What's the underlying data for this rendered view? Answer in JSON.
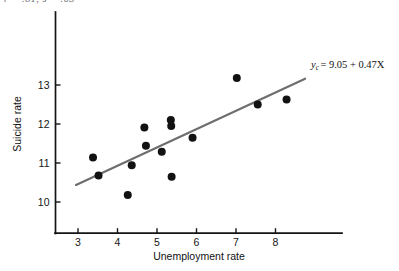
{
  "figure": {
    "background": "#ffffff",
    "clipped_caption": "r = .81, s = .63",
    "width": 399,
    "height": 271
  },
  "chart_data": {
    "type": "scatter",
    "title": "",
    "xlabel": "Unemployment rate",
    "ylabel": "Suicide rate",
    "xlim": [
      2.5,
      9.2
    ],
    "ylim": [
      9.45,
      13.9
    ],
    "xticks": [
      3,
      4,
      5,
      6,
      7,
      8
    ],
    "yticks": [
      10,
      11,
      12,
      13
    ],
    "xtick_labels": [
      "3",
      "4",
      "5",
      "6",
      "7",
      "8"
    ],
    "ytick_labels": [
      "10",
      "11",
      "12",
      "13"
    ],
    "grid": false,
    "legend": "none",
    "marker": {
      "shape": "circle",
      "color": "#121212",
      "size_px": 5.2
    },
    "points": [
      {
        "x": 3.38,
        "y": 11.14
      },
      {
        "x": 3.52,
        "y": 10.68
      },
      {
        "x": 4.26,
        "y": 10.18
      },
      {
        "x": 4.36,
        "y": 10.94
      },
      {
        "x": 4.68,
        "y": 11.91
      },
      {
        "x": 4.72,
        "y": 11.44
      },
      {
        "x": 5.12,
        "y": 11.29
      },
      {
        "x": 5.35,
        "y": 12.1
      },
      {
        "x": 5.36,
        "y": 11.95
      },
      {
        "x": 5.37,
        "y": 10.65
      },
      {
        "x": 5.9,
        "y": 11.65
      },
      {
        "x": 7.02,
        "y": 13.18
      },
      {
        "x": 7.55,
        "y": 12.5
      },
      {
        "x": 8.28,
        "y": 12.63
      }
    ],
    "regression": {
      "equation_display": "yc = 9.05 + 0.47X",
      "equation_lhs": "y",
      "equation_subscript": "c",
      "equation_rhs": "= 9.05 + 0.47X",
      "intercept": 9.05,
      "slope": 0.47,
      "color": "#6e6e6e",
      "width_px": 2.2,
      "x_start": 2.95,
      "x_end": 8.75
    },
    "axis": {
      "color": "#141414",
      "width_px": 1.6,
      "tick_length_px": 5
    }
  }
}
